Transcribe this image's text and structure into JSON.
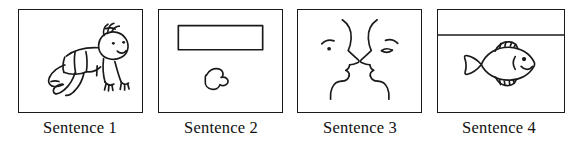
{
  "stimulus": {
    "name": "sentence-picture-panels",
    "panel_count": 4,
    "ink_color": "#1a1a1a",
    "background_color": "#ffffff",
    "panels": [
      {
        "id": "panel-1",
        "caption": "Sentence 1",
        "content_description": "line drawing of a baby crawling on hands and knees, facing right, with a tuft of hair, dot eyes and a smile",
        "icon_name": "crawling-baby-drawing"
      },
      {
        "id": "panel-2",
        "caption": "Sentence 2",
        "content_description": "an empty horizontal rectangle near the top and a small irregular pebble-like blob below it",
        "icon_name": "rectangle-and-blob-drawing"
      },
      {
        "id": "panel-3",
        "caption": "Sentence 3",
        "content_description": "two human faces drawn in profile facing each other, each with an eyebrow, eye, nose, lips and chin",
        "icon_name": "two-facing-profiles-drawing"
      },
      {
        "id": "panel-4",
        "caption": "Sentence 4",
        "content_description": "a horizontal water line near the top of the frame with a fish swimming to the right below it",
        "icon_name": "fish-below-waterline-drawing"
      }
    ]
  }
}
